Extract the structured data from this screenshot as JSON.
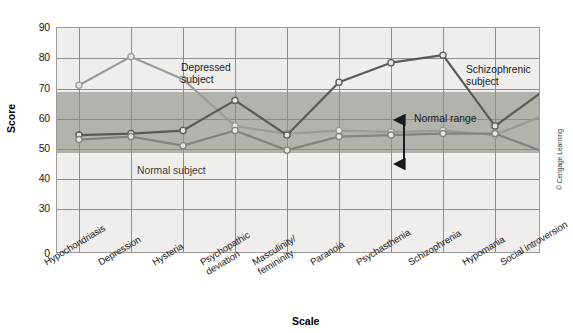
{
  "axes": {
    "ylabel": "Score",
    "xlabel": "Scale",
    "yticks": [
      "90",
      "80",
      "70",
      "60",
      "50",
      "40",
      "30",
      "0"
    ]
  },
  "annotations": {
    "depressed": "Depressed\nsubject",
    "depressed_line1": "Depressed",
    "depressed_line2": "subject",
    "schizophrenic_line1": "Schizophrenic",
    "schizophrenic_line2": "subject",
    "normal_subject": "Normal subject",
    "normal_range": "Normal range"
  },
  "copyright": "© Cengage Learning",
  "colors": {
    "depressed": "#9b9b96",
    "schizophrenic": "#5a5a57",
    "normal": "#83837e",
    "band": "#b3b3ae",
    "plot_bg": "#efeeec",
    "grid": "#8d8d8a"
  },
  "chart_data": {
    "type": "line",
    "title": "",
    "xlabel": "Scale",
    "ylabel": "Score",
    "ylim": [
      0,
      90
    ],
    "yticks": [
      0,
      30,
      40,
      50,
      60,
      70,
      80,
      90
    ],
    "broken_axis": true,
    "broken_axis_note": "Gap between 0 and 30 is compressed",
    "grid": true,
    "legend": "inline annotations",
    "categories": [
      "Hypochondriasis",
      "Depression",
      "Hysteria",
      "Psychopathic deviation",
      "Masculinity/femininity",
      "Paranoia",
      "Psychasthenia",
      "Schizophrenia",
      "Hypomania",
      "Social introversion"
    ],
    "normal_range": [
      45,
      65
    ],
    "series": [
      {
        "name": "Depressed subject",
        "color": "#9b9b96",
        "values": [
          71,
          80.5,
          73,
          57.5,
          55,
          56,
          55.5,
          56,
          54.5,
          61.5
        ]
      },
      {
        "name": "Schizophrenic subject",
        "color": "#5a5a57",
        "values": [
          54.5,
          55,
          56,
          66,
          54.5,
          72,
          78.5,
          81,
          57.5,
          70
        ]
      },
      {
        "name": "Normal subject",
        "color": "#83837e",
        "values": [
          53,
          54,
          51,
          56,
          49.5,
          54,
          54.5,
          55,
          55,
          48.5
        ]
      }
    ]
  }
}
